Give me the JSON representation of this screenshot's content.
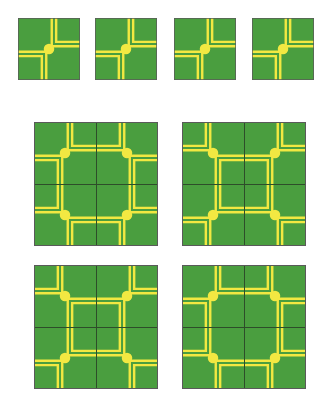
{
  "figure": {
    "colors": {
      "background": "#ffffff",
      "tile_green": "#4a9e3f",
      "tile_yellow": "#f2e842",
      "seam_line": "#2e4d2a",
      "tile_border": "#5a5a5a"
    },
    "tile": {
      "name": "base-tile",
      "shape": "square",
      "features": [
        "yellow dot at center",
        "double-line L bracket at top-right corner",
        "double-line L bracket at bottom-left corner"
      ],
      "dot_count": 1,
      "bracket_count": 2
    }
  },
  "single_tiles": {
    "count": 4,
    "label": "single tiles row",
    "items": [
      {
        "index": 1,
        "rotation": 0
      },
      {
        "index": 2,
        "rotation": 0
      },
      {
        "index": 3,
        "rotation": 0
      },
      {
        "index": 4,
        "rotation": 0
      }
    ]
  },
  "grids": [
    {
      "index": 1,
      "name": "grid-top-left",
      "label": "Arrangement A",
      "rows": 2,
      "cols": 2,
      "rotations": [
        180,
        270,
        90,
        0
      ],
      "pattern": "closed square in center, brackets at outer corners"
    },
    {
      "index": 2,
      "name": "grid-top-right",
      "label": "Arrangement B",
      "rows": 2,
      "cols": 2,
      "rotations": [
        90,
        180,
        0,
        270
      ],
      "pattern": "square in center offset, brackets along edges"
    },
    {
      "index": 3,
      "name": "grid-bottom-left",
      "label": "Arrangement C",
      "rows": 2,
      "cols": 2,
      "rotations": [
        270,
        0,
        180,
        90
      ],
      "pattern": "U shapes at edge midpoints pointing inward"
    },
    {
      "index": 4,
      "name": "grid-bottom-right",
      "label": "Arrangement D",
      "rows": 2,
      "cols": 2,
      "rotations": [
        0,
        90,
        270,
        180
      ],
      "pattern": "C shapes meeting at center, corner brackets"
    }
  ],
  "layout": {
    "single_tile_size": 62,
    "single_tile_y": 18,
    "single_tile_xs": [
      18,
      95,
      174,
      252
    ],
    "grid_tile_size": 62,
    "grid_size": 124,
    "grid_positions": [
      {
        "x": 34,
        "y": 122
      },
      {
        "x": 182,
        "y": 122
      },
      {
        "x": 34,
        "y": 265
      },
      {
        "x": 182,
        "y": 265
      }
    ]
  }
}
